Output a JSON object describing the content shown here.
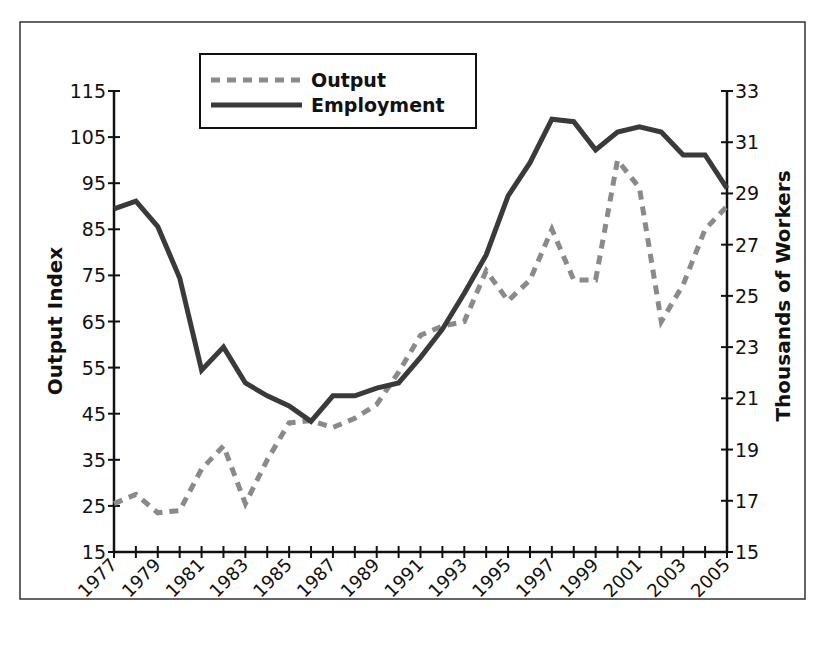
{
  "chart_data": {
    "type": "line",
    "title": "",
    "xlabel": "",
    "ylabel": "Output Index",
    "ylabel_right": "Thousands of Workers",
    "ylim": [
      15,
      115
    ],
    "ylim_right": [
      15,
      33
    ],
    "yticks": [
      15,
      25,
      35,
      45,
      55,
      65,
      75,
      85,
      95,
      105,
      115
    ],
    "yticks_right": [
      15,
      17,
      19,
      21,
      23,
      25,
      27,
      29,
      31,
      33
    ],
    "xtick_labels": [
      "1977",
      "1979",
      "1981",
      "1983",
      "1985",
      "1987",
      "1989",
      "1991",
      "1993",
      "1995",
      "1997",
      "1999",
      "2001",
      "2003",
      "2005"
    ],
    "x": [
      1977,
      1978,
      1979,
      1980,
      1981,
      1982,
      1983,
      1984,
      1985,
      1986,
      1987,
      1988,
      1989,
      1990,
      1991,
      1992,
      1993,
      1994,
      1995,
      1996,
      1997,
      1998,
      1999,
      2000,
      2001,
      2002,
      2003,
      2004,
      2005
    ],
    "series": [
      {
        "name": "Output",
        "axis": "left",
        "style": "dashed",
        "color": "#8a8a8a",
        "values": [
          25.5,
          27.5,
          23.5,
          24,
          33,
          38,
          25.5,
          35,
          43,
          43.5,
          42,
          44,
          47,
          54,
          62,
          64,
          65,
          76,
          69.5,
          74,
          85,
          74,
          74,
          100,
          94,
          65,
          73,
          85,
          90
        ]
      },
      {
        "name": "Employment",
        "axis": "right",
        "style": "solid",
        "color": "#3a3a3a",
        "values": [
          28.4,
          28.7,
          27.7,
          25.7,
          22.1,
          23.0,
          21.6,
          21.1,
          20.7,
          20.1,
          21.1,
          21.1,
          21.4,
          21.6,
          22.6,
          23.7,
          25.1,
          26.6,
          28.9,
          30.2,
          31.9,
          31.8,
          30.7,
          31.4,
          31.6,
          31.4,
          30.5,
          30.5,
          29.2
        ]
      }
    ],
    "legend": {
      "position": "top-left",
      "entries": [
        "Output",
        "Employment"
      ]
    },
    "grid": false
  }
}
